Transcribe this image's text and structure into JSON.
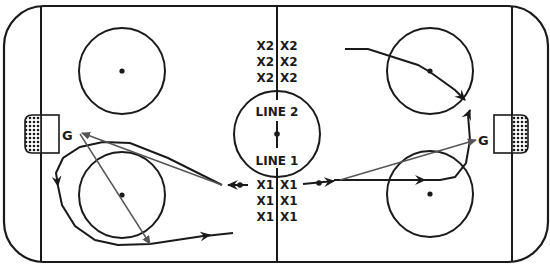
{
  "diagram": {
    "colors": {
      "ink": "#1a1a1a",
      "pass": "#555555",
      "background": "#ffffff"
    },
    "labels": {
      "line2": "LINE 2",
      "line1": "LINE 1",
      "goalie_left": "G",
      "goalie_right": "G"
    },
    "players_line2": {
      "left": [
        "X2",
        "X2",
        "X2"
      ],
      "right": [
        "X2",
        "X2",
        "X2"
      ]
    },
    "players_line1": {
      "left": [
        "X1",
        "X1",
        "X1"
      ],
      "right": [
        "X1",
        "X1",
        "X1"
      ]
    }
  }
}
